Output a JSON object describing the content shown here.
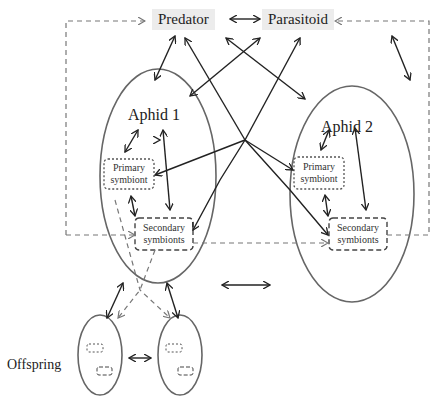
{
  "nodes": {
    "predator": "Predator",
    "parasitoid": "Parasitoid",
    "aphid1": "Aphid 1",
    "aphid2": "Aphid 2",
    "primary1a": "Primary",
    "primary1b": "symbiont",
    "secondary1a": "Secondary",
    "secondary1b": "symbionts",
    "primary2a": "Primary",
    "primary2b": "symbiont",
    "secondary2a": "Secondary",
    "secondary2b": "symbionts",
    "offspring": "Offspring"
  },
  "colors": {
    "line": "#222222",
    "ellipse": "#666666",
    "dashed": "#777777",
    "label_bg": "#ececec"
  }
}
